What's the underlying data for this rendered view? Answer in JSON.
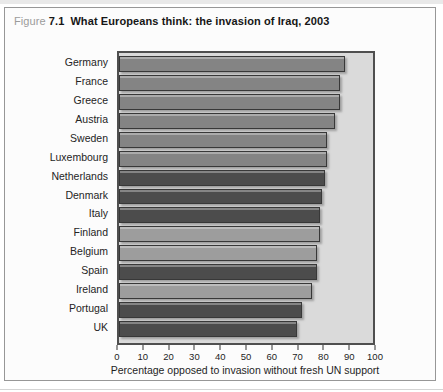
{
  "figure": {
    "prefix": "Figure",
    "number": "7.1",
    "title": "What Europeans think: the invasion of Iraq, 2003"
  },
  "chart_data": {
    "type": "bar",
    "orientation": "horizontal",
    "title": "What Europeans think: the invasion of Iraq, 2003",
    "xlabel": "Percentage opposed to invasion without fresh UN support",
    "xlim": [
      0,
      100
    ],
    "xticks": [
      0,
      10,
      20,
      30,
      40,
      50,
      60,
      70,
      80,
      90,
      100
    ],
    "grid": false,
    "legend": false,
    "categories": [
      "Germany",
      "France",
      "Greece",
      "Austria",
      "Sweden",
      "Luxembourg",
      "Netherlands",
      "Denmark",
      "Italy",
      "Finland",
      "Belgium",
      "Spain",
      "Ireland",
      "Portugal",
      "UK"
    ],
    "values": [
      89,
      87,
      87,
      85,
      82,
      82,
      81,
      80,
      79,
      79,
      78,
      78,
      76,
      72,
      70
    ],
    "tones": [
      "medium",
      "medium",
      "medium",
      "medium",
      "medium",
      "medium",
      "dark",
      "dark",
      "dark",
      "light",
      "light",
      "dark",
      "light",
      "dark",
      "dark"
    ],
    "colors": {
      "medium": "#848484",
      "dark": "#4c4c4c",
      "light": "#9d9d9d",
      "plot_background": "#dadada",
      "bar_border": "#383838",
      "axis": "#4f4f4f",
      "text": "#1e1e1e",
      "figure_prefix_gray": "#9b9b9b"
    }
  }
}
